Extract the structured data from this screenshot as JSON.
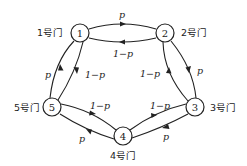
{
  "diagram": {
    "type": "markov-chain-state-diagram",
    "nodes": [
      {
        "id": "1",
        "label": "1",
        "door_label": "1号门",
        "x": 80,
        "y": 33
      },
      {
        "id": "2",
        "label": "2",
        "door_label": "2号门",
        "x": 165,
        "y": 33
      },
      {
        "id": "3",
        "label": "3",
        "door_label": "3号门",
        "x": 195,
        "y": 107
      },
      {
        "id": "4",
        "label": "4",
        "door_label": "4号门",
        "x": 123,
        "y": 136
      },
      {
        "id": "5",
        "label": "5",
        "door_label": "5号门",
        "x": 52,
        "y": 107
      }
    ],
    "edges": [
      {
        "from": "1",
        "to": "2",
        "label": "p"
      },
      {
        "from": "2",
        "to": "1",
        "label": "1−p"
      },
      {
        "from": "2",
        "to": "3",
        "label": "p"
      },
      {
        "from": "3",
        "to": "2",
        "label": "1−p"
      },
      {
        "from": "3",
        "to": "4",
        "label": "p"
      },
      {
        "from": "4",
        "to": "3",
        "label": "1−p"
      },
      {
        "from": "4",
        "to": "5",
        "label": "p"
      },
      {
        "from": "5",
        "to": "4",
        "label": "1−p"
      },
      {
        "from": "5",
        "to": "1",
        "label": "p"
      },
      {
        "from": "1",
        "to": "5",
        "label": "1−p"
      }
    ]
  }
}
